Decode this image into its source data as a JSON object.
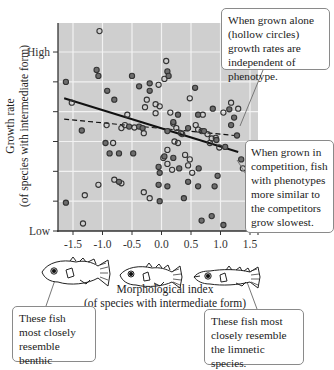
{
  "chart_data": {
    "type": "scatter",
    "title": "",
    "xlabel": "Morphological index\n(of species with intermediate form)",
    "xlabel_lines": [
      "Morphological index",
      "(of species with intermediate form)"
    ],
    "ylabel": "Growth rate\n(of species with intermediate form)",
    "ylabel_lines": [
      "Growth rate",
      "(of species with intermediate form)"
    ],
    "x_ticks": [
      "-1.5",
      "-1.0",
      "-0.5",
      "0.0",
      "0.5",
      "1.0",
      "1.5"
    ],
    "x_tick_values": [
      -1.5,
      -1.0,
      -0.5,
      0.0,
      0.5,
      1.0,
      1.5
    ],
    "y_tick_labels": {
      "high": "High",
      "low": "Low"
    },
    "xlim": [
      -1.78,
      1.58
    ],
    "ylim": [
      0,
      7
    ],
    "grid": true,
    "series": [
      {
        "name": "Grown alone (hollow circles)",
        "marker": "hollow-circle",
        "fit": "dashed",
        "fit_line": [
          [
            -1.65,
            3.75
          ],
          [
            1.25,
            3.2
          ]
        ],
        "points": [
          [
            -1.52,
            4.3
          ],
          [
            -1.05,
            6.7
          ],
          [
            -0.93,
            3.55
          ],
          [
            -0.58,
            3.9
          ],
          [
            -0.82,
            2.95
          ],
          [
            -0.68,
            3.45
          ],
          [
            -0.46,
            3.47
          ],
          [
            -0.28,
            4.15
          ],
          [
            -0.25,
            4.4
          ],
          [
            -0.3,
            3.28
          ],
          [
            -0.1,
            4.25
          ],
          [
            -0.03,
            4.18
          ],
          [
            0.08,
            5.7
          ],
          [
            0.05,
            5.1
          ],
          [
            -0.05,
            4.9
          ],
          [
            0.15,
            3.97
          ],
          [
            0.2,
            3.6
          ],
          [
            0.25,
            3.45
          ],
          [
            0.33,
            3.28
          ],
          [
            0.22,
            3.0
          ],
          [
            0.1,
            2.72
          ],
          [
            0.28,
            2.95
          ],
          [
            0.35,
            3.25
          ],
          [
            0.48,
            4.45
          ],
          [
            0.62,
            3.4
          ],
          [
            0.7,
            3.9
          ],
          [
            0.78,
            3.25
          ],
          [
            0.82,
            2.95
          ],
          [
            0.92,
            3.12
          ],
          [
            1.05,
            3.97
          ],
          [
            0.98,
            2.8
          ],
          [
            1.18,
            4.3
          ],
          [
            1.3,
            4.1
          ],
          [
            1.38,
            2.1
          ],
          [
            -1.33,
            0.25
          ],
          [
            -1.07,
            1.55
          ],
          [
            -1.3,
            1.2
          ],
          [
            -0.8,
            1.72
          ],
          [
            -0.68,
            1.6
          ],
          [
            -0.3,
            1.3
          ],
          [
            -0.2,
            1.1
          ],
          [
            0.03,
            2.45
          ],
          [
            0.1,
            2.25
          ],
          [
            0.18,
            2.05
          ],
          [
            0.45,
            2.2
          ],
          [
            0.52,
            1.95
          ],
          [
            0.58,
            3.55
          ],
          [
            0.68,
            3.35
          ],
          [
            0.85,
            3.1
          ],
          [
            -0.62,
            3.55
          ],
          [
            -0.1,
            3.95
          ],
          [
            0.4,
            2.55
          ],
          [
            0.48,
            2.4
          ]
        ]
      },
      {
        "name": "Grown in competition (filled circles)",
        "marker": "filled-circle",
        "fit": "solid",
        "fit_line": [
          [
            -1.65,
            4.45
          ],
          [
            1.3,
            2.65
          ]
        ],
        "points": [
          [
            -1.62,
            5.0
          ],
          [
            -1.35,
            3.37
          ],
          [
            -1.1,
            5.4
          ],
          [
            -1.07,
            5.2
          ],
          [
            -0.92,
            4.7
          ],
          [
            -0.8,
            4.4
          ],
          [
            -0.55,
            3.5
          ],
          [
            -0.5,
            5.2
          ],
          [
            -0.38,
            4.85
          ],
          [
            -0.38,
            3.5
          ],
          [
            -0.32,
            3.45
          ],
          [
            -0.2,
            4.95
          ],
          [
            -0.2,
            4.7
          ],
          [
            0.1,
            3.35
          ],
          [
            0.1,
            5.35
          ],
          [
            0.12,
            5.2
          ],
          [
            0.2,
            3.65
          ],
          [
            0.28,
            3.9
          ],
          [
            0.45,
            3.45
          ],
          [
            0.57,
            4.8
          ],
          [
            0.62,
            3.9
          ],
          [
            0.72,
            3.35
          ],
          [
            0.87,
            4.1
          ],
          [
            0.93,
            3.05
          ],
          [
            1.08,
            2.82
          ],
          [
            1.15,
            4.08
          ],
          [
            1.18,
            3.55
          ],
          [
            1.23,
            3.8
          ],
          [
            1.28,
            3.2
          ],
          [
            1.35,
            2.4
          ],
          [
            -1.62,
            0.95
          ],
          [
            -0.95,
            2.95
          ],
          [
            -0.88,
            2.6
          ],
          [
            -0.72,
            2.6
          ],
          [
            -0.72,
            1.65
          ],
          [
            -0.48,
            2.6
          ],
          [
            -0.05,
            2.15
          ],
          [
            -0.03,
            1.95
          ],
          [
            -0.05,
            1.55
          ],
          [
            -0.03,
            1.0
          ],
          [
            0.05,
            2.5
          ],
          [
            0.1,
            1.5
          ],
          [
            0.2,
            2.45
          ],
          [
            0.3,
            2.1
          ],
          [
            0.38,
            1.1
          ],
          [
            0.45,
            1.65
          ],
          [
            0.62,
            1.5
          ],
          [
            0.68,
            0.35
          ],
          [
            0.85,
            0.5
          ],
          [
            0.9,
            1.5
          ],
          [
            0.95,
            1.85
          ],
          [
            1.05,
            0.2
          ],
          [
            0.63,
            2.1
          ]
        ]
      }
    ],
    "annotations": [
      "When grown alone (hollow circles) growth rates are independent of phenotype.",
      "When grown in competition, fish with phenotypes more similar to the competitors grow slowest.",
      "These fish most closely resemble benthic species.",
      "These fish most closely resemble the limnetic species."
    ],
    "legend": null
  },
  "callouts": {
    "alone": "When grown alone (hollow circles) growth rates are independent of phenotype.",
    "competition": "When grown in competition, fish with phenotypes more similar to the competitors grow slowest.",
    "benthic": "These fish most closely resemble benthic species.",
    "limnetic": "These fish most closely resemble the limnetic species."
  },
  "axes": {
    "x_title_line1": "Morphological index",
    "x_title_line2": "(of species with intermediate form)",
    "y_title_line1": "Growth rate",
    "y_title_line2": "(of species with intermediate form)",
    "y_high": "High",
    "y_low": "Low"
  },
  "fish_icons": [
    "benthic-fish-icon",
    "intermediate-fish-icon",
    "limnetic-fish-icon"
  ],
  "colors": {
    "plot_bg": "#cfcfcf",
    "grid": "#f2f2f2",
    "filled_marker": "#6d6d6d",
    "marker_edge": "#333333",
    "fit_line": "#111111"
  }
}
